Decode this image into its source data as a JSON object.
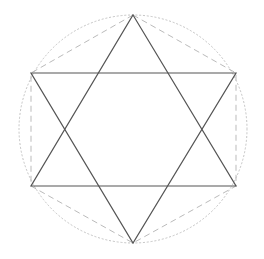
{
  "diagram": {
    "type": "geometric-construction",
    "shape": "hexagram",
    "canvas": {
      "width": 264,
      "height": 259
    },
    "colors": {
      "background": "#ffffff",
      "solid_line": "#555555",
      "dashed_line": "#bbbbbb",
      "dotted_circle": "#c4c4c4"
    },
    "circumscribed_circle": {
      "cx": 133,
      "cy": 129,
      "r": 114,
      "style": "dotted"
    },
    "vertices": {
      "top": [
        133,
        15
      ],
      "upper_right": [
        236,
        73
      ],
      "lower_right": [
        236,
        186
      ],
      "bottom": [
        133,
        243
      ],
      "lower_left": [
        31,
        186
      ],
      "upper_left": [
        31,
        73
      ]
    },
    "triangles": [
      {
        "name": "upward-triangle",
        "points": [
          [
            133,
            15
          ],
          [
            236,
            186
          ],
          [
            31,
            186
          ]
        ],
        "style": "solid"
      },
      {
        "name": "downward-triangle",
        "points": [
          [
            31,
            73
          ],
          [
            236,
            73
          ],
          [
            133,
            243
          ]
        ],
        "style": "solid"
      }
    ],
    "hexagon": {
      "name": "outer-hexagon",
      "points": [
        [
          133,
          15
        ],
        [
          236,
          73
        ],
        [
          236,
          186
        ],
        [
          133,
          243
        ],
        [
          31,
          186
        ],
        [
          31,
          73
        ]
      ],
      "style": "dashed"
    }
  }
}
